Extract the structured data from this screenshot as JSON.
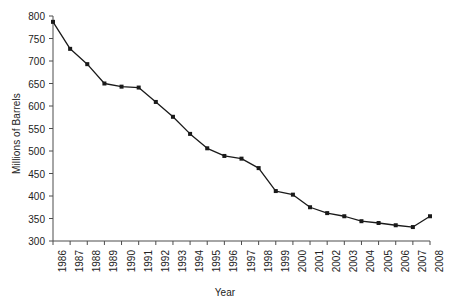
{
  "chart_data": {
    "type": "line",
    "title": "",
    "xlabel": "Year",
    "ylabel": "Millions of Barrels",
    "categories": [
      "1986",
      "1987",
      "1988",
      "1989",
      "1990",
      "1991",
      "1992",
      "1993",
      "1994",
      "1995",
      "1996",
      "1997",
      "1998",
      "1999",
      "2000",
      "2001",
      "2002",
      "2003",
      "2004",
      "2005",
      "2006",
      "2007",
      "2008"
    ],
    "values": [
      787,
      727,
      693,
      650,
      643,
      641,
      609,
      576,
      538,
      506,
      489,
      483,
      462,
      411,
      403,
      375,
      362,
      355,
      344,
      340,
      335,
      331,
      355
    ],
    "series": [
      {
        "name": "Millions of Barrels",
        "values": [
          787,
          727,
          693,
          650,
          643,
          641,
          609,
          576,
          538,
          506,
          489,
          483,
          462,
          411,
          403,
          375,
          362,
          355,
          344,
          340,
          335,
          331,
          355
        ]
      }
    ],
    "ylim": [
      300,
      800
    ],
    "yticks": [
      300,
      350,
      400,
      450,
      500,
      550,
      600,
      650,
      700,
      750,
      800
    ],
    "ytick_labels": [
      "300",
      "350",
      "400",
      "450",
      "500",
      "550",
      "600",
      "650",
      "700",
      "750",
      "800"
    ],
    "xlim": [
      "1986",
      "2008"
    ],
    "grid": false,
    "legend": "none",
    "line_color": "#1a1a1a",
    "marker": "square",
    "marker_color": "#1a1a1a",
    "axis_color": "#4d4d4d",
    "background": "#ffffff"
  }
}
